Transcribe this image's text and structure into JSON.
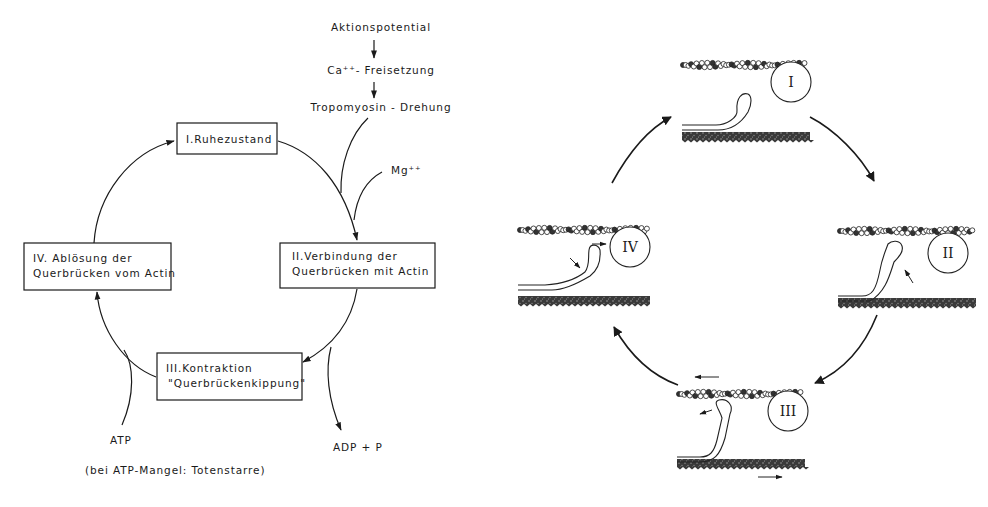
{
  "left_cycle": {
    "top_chain": [
      "Aktionspotential",
      "Ca⁺⁺- Freisetzung",
      "Tropomyosin - Drehung"
    ],
    "cofactor": "Mg⁺⁺",
    "boxes": {
      "I": [
        "I.Ruhezustand"
      ],
      "II": [
        "II.Verbindung der",
        "Querbrücken mit Actin"
      ],
      "III": [
        "III.Kontraktion",
        "\"Querbrückenkippung\""
      ],
      "IV": [
        "IV. Ablösung der",
        "Querbrücken vom Actin"
      ]
    },
    "input": "ATP",
    "output": "ADP + P",
    "note": "(bei ATP-Mangel: Totenstarre)"
  },
  "right_cycle": {
    "panels": [
      {
        "label": "I"
      },
      {
        "label": "II"
      },
      {
        "label": "III"
      },
      {
        "label": "IV"
      }
    ]
  }
}
